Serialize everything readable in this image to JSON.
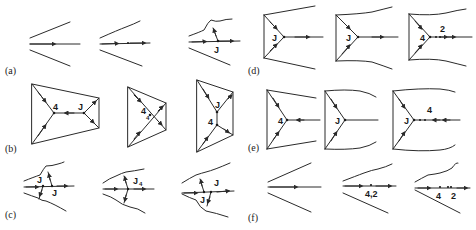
{
  "figure": {
    "panels": [
      {
        "id": "a",
        "label": "(a)",
        "frames": [
          {
            "labels": []
          },
          {
            "labels": []
          },
          {
            "labels": [
              "J"
            ]
          }
        ]
      },
      {
        "id": "b",
        "label": "(b)",
        "frames": [
          {
            "labels": [
              "4",
              "J"
            ]
          },
          {
            "labels": [
              "4",
              "4"
            ]
          },
          {
            "labels": [
              "J",
              "4"
            ]
          }
        ]
      },
      {
        "id": "c",
        "label": "(c)",
        "frames": [
          {
            "labels": [
              "J",
              "J"
            ]
          },
          {
            "labels": [
              "J",
              "4"
            ]
          },
          {
            "labels": [
              "J",
              "J"
            ]
          }
        ]
      },
      {
        "id": "d",
        "label": "(d)",
        "frames": [
          {
            "labels": [
              "J"
            ]
          },
          {
            "labels": [
              "J"
            ]
          },
          {
            "labels": [
              "4",
              "2"
            ]
          }
        ]
      },
      {
        "id": "e",
        "label": "(e)",
        "frames": [
          {
            "labels": [
              "4"
            ]
          },
          {
            "labels": [
              "J"
            ]
          },
          {
            "labels": [
              "J",
              "4"
            ]
          }
        ]
      },
      {
        "id": "f",
        "label": "(f)",
        "frames": [
          {
            "labels": []
          },
          {
            "labels": [
              "4,2"
            ]
          },
          {
            "labels": [
              "4",
              "2"
            ]
          }
        ]
      }
    ]
  }
}
